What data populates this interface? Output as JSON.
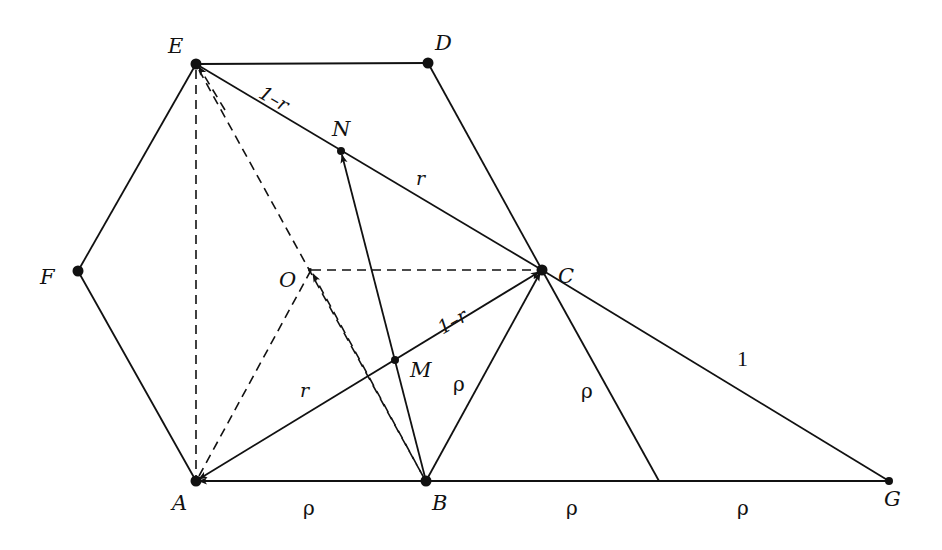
{
  "diagram": {
    "type": "geometry-figure",
    "colors": {
      "ink": "#111111",
      "background": "#ffffff"
    },
    "points": {
      "A": {
        "label": "A",
        "x": 196,
        "y": 481
      },
      "B": {
        "label": "B",
        "x": 426,
        "y": 481
      },
      "C": {
        "label": "C",
        "x": 542,
        "y": 270
      },
      "D": {
        "label": "D",
        "x": 428,
        "y": 63
      },
      "E": {
        "label": "E",
        "x": 196,
        "y": 64
      },
      "F": {
        "label": "F",
        "x": 78,
        "y": 271
      },
      "O": {
        "label": "O",
        "x": 310,
        "y": 270
      },
      "M": {
        "label": "M",
        "x": 395,
        "y": 360
      },
      "N": {
        "label": "N",
        "x": 341,
        "y": 151
      },
      "G": {
        "label": "G",
        "x": 889,
        "y": 481
      },
      "P": {
        "label": "",
        "x": 659,
        "y": 481
      }
    },
    "segment_labels": {
      "EN": "1–r",
      "NC": "r",
      "AM": "r",
      "MC": "1–r",
      "AB": "ρ",
      "BC": "ρ",
      "CP": "ρ",
      "BP": "ρ",
      "PG": "ρ",
      "CG": "1"
    }
  }
}
